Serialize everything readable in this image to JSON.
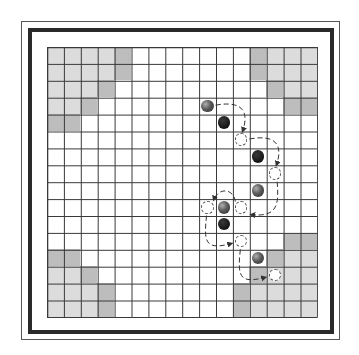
{
  "board": {
    "size": 16,
    "origin": [
      46.7,
      46.7
    ],
    "cell": 16.9,
    "colors": {
      "grid_line": "#3a3a3a",
      "light_zone": "#dcdcdc",
      "dark_zone": "#bdbdbd",
      "empty": "#ffffff",
      "gray_marble": "#5a5a5a",
      "black_marble": "#1a1a1a",
      "hollow_outline": "#555555",
      "arrow": "#333333"
    },
    "corner_zones": [
      {
        "name": "top-left",
        "light": [
          [
            0,
            0
          ],
          [
            0,
            1
          ],
          [
            0,
            2
          ],
          [
            0,
            3
          ],
          [
            1,
            0
          ],
          [
            1,
            1
          ],
          [
            1,
            2
          ],
          [
            1,
            3
          ],
          [
            2,
            0
          ],
          [
            2,
            1
          ],
          [
            2,
            2
          ],
          [
            3,
            0
          ],
          [
            3,
            1
          ]
        ],
        "dark": [
          [
            0,
            4
          ],
          [
            1,
            4
          ],
          [
            2,
            3
          ],
          [
            3,
            2
          ],
          [
            4,
            0
          ],
          [
            4,
            1
          ]
        ]
      },
      {
        "name": "top-right",
        "light": [
          [
            0,
            13
          ],
          [
            0,
            14
          ],
          [
            0,
            15
          ],
          [
            1,
            13
          ],
          [
            1,
            14
          ],
          [
            1,
            15
          ],
          [
            2,
            14
          ],
          [
            2,
            15
          ]
        ],
        "dark": [
          [
            0,
            12
          ],
          [
            1,
            12
          ],
          [
            2,
            13
          ],
          [
            3,
            14
          ],
          [
            3,
            15
          ]
        ]
      },
      {
        "name": "bottom-left",
        "light": [
          [
            13,
            0
          ],
          [
            13,
            1
          ],
          [
            14,
            0
          ],
          [
            14,
            1
          ],
          [
            14,
            2
          ],
          [
            15,
            0
          ],
          [
            15,
            1
          ],
          [
            15,
            2
          ]
        ],
        "dark": [
          [
            12,
            0
          ],
          [
            12,
            1
          ],
          [
            13,
            2
          ],
          [
            14,
            3
          ],
          [
            15,
            3
          ]
        ]
      },
      {
        "name": "bottom-right",
        "light": [
          [
            12,
            14
          ],
          [
            12,
            15
          ],
          [
            13,
            13
          ],
          [
            13,
            14
          ],
          [
            13,
            15
          ],
          [
            14,
            12
          ],
          [
            14,
            13
          ],
          [
            14,
            14
          ],
          [
            14,
            15
          ],
          [
            15,
            12
          ],
          [
            15,
            13
          ],
          [
            15,
            14
          ],
          [
            15,
            15
          ]
        ],
        "dark": [
          [
            11,
            14
          ],
          [
            11,
            15
          ],
          [
            12,
            13
          ],
          [
            13,
            12
          ],
          [
            14,
            11
          ],
          [
            15,
            11
          ]
        ]
      }
    ],
    "pieces": [
      {
        "type": "gray",
        "row": 3,
        "col": 9
      },
      {
        "type": "black",
        "row": 4,
        "col": 10
      },
      {
        "type": "hollow",
        "row": 5,
        "col": 11
      },
      {
        "type": "black",
        "row": 6,
        "col": 12
      },
      {
        "type": "hollow",
        "row": 7,
        "col": 13
      },
      {
        "type": "gray",
        "row": 8,
        "col": 12
      },
      {
        "type": "hollow",
        "row": 9,
        "col": 9
      },
      {
        "type": "gray",
        "row": 9,
        "col": 10
      },
      {
        "type": "hollow",
        "row": 9,
        "col": 11
      },
      {
        "type": "black",
        "row": 10,
        "col": 10
      },
      {
        "type": "hollow",
        "row": 11,
        "col": 11
      },
      {
        "type": "gray",
        "row": 12,
        "col": 12
      },
      {
        "type": "hollow",
        "row": 13,
        "col": 13
      }
    ],
    "jump_arrows": [
      {
        "from": [
          3,
          9
        ],
        "to": [
          5,
          11
        ]
      },
      {
        "from": [
          5,
          11
        ],
        "to": [
          7,
          13
        ]
      },
      {
        "from": [
          7,
          13
        ],
        "to": [
          9,
          11
        ]
      },
      {
        "from": [
          9,
          11
        ],
        "to": [
          9,
          9
        ]
      },
      {
        "from": [
          9,
          9
        ],
        "to": [
          11,
          11
        ]
      },
      {
        "from": [
          11,
          11
        ],
        "to": [
          13,
          13
        ]
      }
    ]
  }
}
